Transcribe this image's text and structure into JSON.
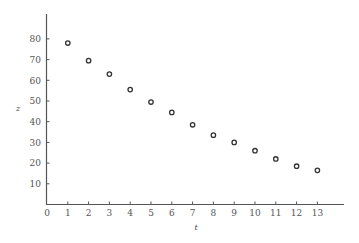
{
  "chart_data": {
    "type": "scatter",
    "title": "",
    "xlabel": "t",
    "ylabel": "z",
    "xlim": [
      0,
      14.3
    ],
    "ylim": [
      0,
      91
    ],
    "grid": false,
    "legend": null,
    "x_ticks": [
      0,
      1,
      2,
      3,
      4,
      5,
      6,
      7,
      8,
      9,
      10,
      11,
      12,
      13
    ],
    "y_ticks": [
      10,
      20,
      30,
      40,
      50,
      60,
      70,
      80
    ],
    "marker": "open-circle",
    "series": [
      {
        "name": "z",
        "x": [
          1,
          2,
          3,
          4,
          5,
          6,
          7,
          8,
          9,
          10,
          11,
          12,
          13
        ],
        "values": [
          78,
          69.5,
          63,
          55.5,
          49.5,
          44.5,
          38.5,
          33.5,
          30,
          26,
          22,
          18.5,
          16.5
        ]
      }
    ]
  },
  "axes": {
    "x_label": "t",
    "y_label": "z"
  }
}
